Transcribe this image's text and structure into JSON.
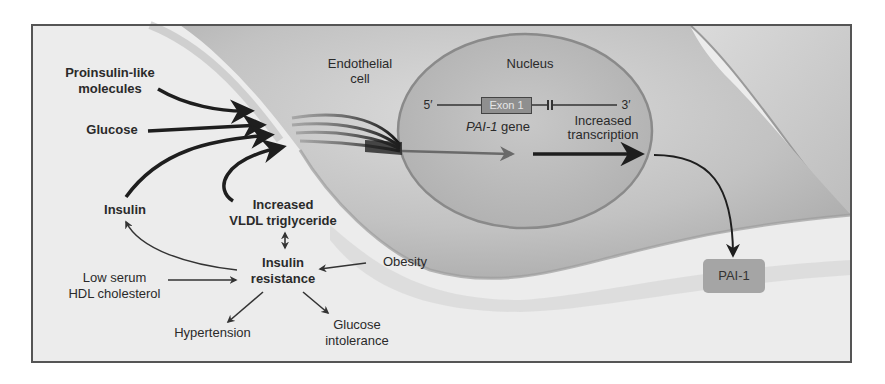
{
  "diagram": {
    "title": "",
    "regions": {
      "cell_label": "Endothelial\ncell",
      "nucleus_label": "Nucleus"
    },
    "gene": {
      "five_prime": "5′",
      "three_prime": "3′",
      "exon_label": "Exon 1",
      "gene_name": "PAI-1",
      "gene_suffix": " gene",
      "transcription_label": "Increased\ntranscription"
    },
    "inputs": [
      {
        "id": "proinsulin",
        "label": "Proinsulin-like\nmolecules"
      },
      {
        "id": "glucose",
        "label": "Glucose"
      },
      {
        "id": "insulin",
        "label": "Insulin"
      },
      {
        "id": "vldl",
        "label": "Increased\nVLDL triglyceride"
      }
    ],
    "syndrome": {
      "center": "Insulin\nresistance",
      "obesity": "Obesity",
      "low_hdl": "Low serum\nHDL cholesterol",
      "hypertension": "Hypertension",
      "glucose_intolerance": "Glucose\nintolerance"
    },
    "output": {
      "label": "PAI-1"
    },
    "colors": {
      "frame": "#555555",
      "background_light": "#eeeeee",
      "cell_shade": "#c4c4c4",
      "nucleus_fill": "#b8b8b8",
      "arrow": "#1e1e1e",
      "exon_fill": "#8f8f8f",
      "pai1_fill": "#a5a5a5"
    }
  }
}
